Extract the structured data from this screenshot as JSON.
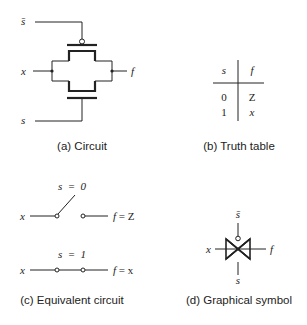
{
  "panels": {
    "a": {
      "caption": "(a) Circuit",
      "labels": {
        "s_bar": "s̄",
        "x": "x",
        "f": "f",
        "s": "s"
      }
    },
    "b": {
      "caption": "(b) Truth table",
      "headers": [
        "s",
        "f"
      ],
      "rows": [
        [
          "0",
          "Z"
        ],
        [
          "1",
          "x"
        ]
      ]
    },
    "c": {
      "caption": "(c) Equivalent circuit",
      "case0": {
        "cond": "s  =  0",
        "in": "x",
        "out_f": "f",
        "out_eq": " = Z"
      },
      "case1": {
        "cond": "s  =  1",
        "in": "x",
        "out_f": "f",
        "out_eq": " = x"
      }
    },
    "d": {
      "caption": "(d) Graphical symbol",
      "labels": {
        "s_bar": "s̄",
        "x": "x",
        "f": "f",
        "s": "s"
      }
    }
  },
  "colors": {
    "ink": "#222222",
    "background": "#ffffff"
  }
}
